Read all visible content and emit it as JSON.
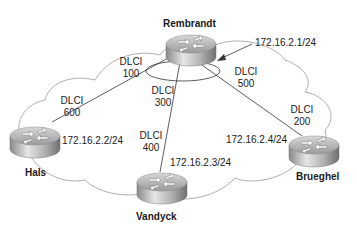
{
  "diagram": {
    "type": "frame-relay-hub-and-spoke",
    "routers": [
      {
        "name": "Rembrandt",
        "ip": "172.16.2.1/24",
        "role": "hub"
      },
      {
        "name": "Hals",
        "ip": "172.16.2.2/24",
        "role": "spoke"
      },
      {
        "name": "Vandyck",
        "ip": "172.16.2.3/24",
        "role": "spoke"
      },
      {
        "name": "Brueghel",
        "ip": "172.16.2.4/24",
        "role": "spoke"
      }
    ],
    "dlcis": [
      {
        "label": "DLCI",
        "value": "100"
      },
      {
        "label": "DLCI",
        "value": "600"
      },
      {
        "label": "DLCI",
        "value": "300"
      },
      {
        "label": "DLCI",
        "value": "400"
      },
      {
        "label": "DLCI",
        "value": "500"
      },
      {
        "label": "DLCI",
        "value": "200"
      }
    ]
  }
}
